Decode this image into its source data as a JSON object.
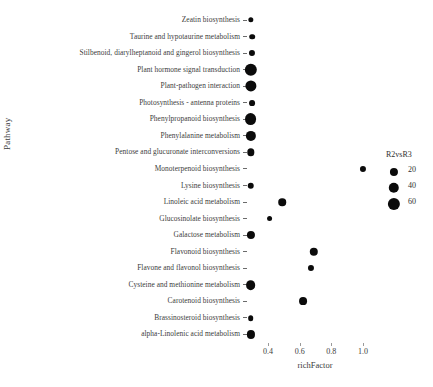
{
  "chart_data": {
    "type": "scatter",
    "title": "",
    "xlabel": "richFactor",
    "ylabel": "Pathway",
    "xlim": [
      0.26,
      1.06
    ],
    "grid": false,
    "legend": {
      "title": "R2vsR3",
      "position": "right",
      "entries": [
        {
          "label": "20",
          "size": 20
        },
        {
          "label": "40",
          "size": 40
        },
        {
          "label": "60",
          "size": 60
        }
      ]
    },
    "xticks": [
      0.4,
      0.6,
      0.8,
      1.0
    ],
    "xticklabels": [
      "0.4",
      "0.6",
      "0.8",
      "1.0"
    ],
    "categories": [
      "Zeatin biosynthesis",
      "Taurine and hypotaurine metabolism",
      "Stilbenoid, diarylheptanoid and gingerol biosynthesis",
      "Plant hormone signal transduction",
      "Plant-pathogen interaction",
      "Photosynthesis - antenna proteins",
      "Phenylpropanoid biosynthesis",
      "Phenylalanine metabolism",
      "Pentose and glucuronate interconversions",
      "Monoterpenoid biosynthesis",
      "Lysine biosynthesis",
      "Linoleic acid metabolism",
      "Glucosinolate biosynthesis",
      "Galactose metabolism",
      "Flavonoid biosynthesis",
      "Flavone and flavonol biosynthesis",
      "Cysteine and methionine metabolism",
      "Carotenoid biosynthesis",
      "Brassinosteroid biosynthesis",
      "alpha-Linolenic acid metabolism"
    ],
    "points": [
      {
        "pathway": "Zeatin biosynthesis",
        "richFactor": 0.29,
        "count": 5
      },
      {
        "pathway": "Taurine and hypotaurine metabolism",
        "richFactor": 0.3,
        "count": 6
      },
      {
        "pathway": "Stilbenoid, diarylheptanoid and gingerol biosynthesis",
        "richFactor": 0.3,
        "count": 8
      },
      {
        "pathway": "Plant hormone signal transduction",
        "richFactor": 0.29,
        "count": 62
      },
      {
        "pathway": "Plant-pathogen interaction",
        "richFactor": 0.29,
        "count": 48
      },
      {
        "pathway": "Photosynthesis - antenna proteins",
        "richFactor": 0.3,
        "count": 7
      },
      {
        "pathway": "Phenylpropanoid biosynthesis",
        "richFactor": 0.29,
        "count": 56
      },
      {
        "pathway": "Phenylalanine metabolism",
        "richFactor": 0.29,
        "count": 38
      },
      {
        "pathway": "Pentose and glucuronate interconversions",
        "richFactor": 0.29,
        "count": 15
      },
      {
        "pathway": "Monoterpenoid biosynthesis",
        "richFactor": 1.0,
        "count": 8
      },
      {
        "pathway": "Lysine biosynthesis",
        "richFactor": 0.29,
        "count": 10
      },
      {
        "pathway": "Linoleic acid metabolism",
        "richFactor": 0.49,
        "count": 16
      },
      {
        "pathway": "Glucosinolate biosynthesis",
        "richFactor": 0.41,
        "count": 7
      },
      {
        "pathway": "Galactose metabolism",
        "richFactor": 0.29,
        "count": 20
      },
      {
        "pathway": "Flavonoid biosynthesis",
        "richFactor": 0.69,
        "count": 22
      },
      {
        "pathway": "Flavone and flavonol biosynthesis",
        "richFactor": 0.67,
        "count": 8
      },
      {
        "pathway": "Cysteine and methionine metabolism",
        "richFactor": 0.29,
        "count": 33
      },
      {
        "pathway": "Carotenoid biosynthesis",
        "richFactor": 0.62,
        "count": 18
      },
      {
        "pathway": "Brassinosteroid biosynthesis",
        "richFactor": 0.29,
        "count": 6
      },
      {
        "pathway": "alpha-Linolenic acid metabolism",
        "richFactor": 0.29,
        "count": 20
      }
    ]
  }
}
